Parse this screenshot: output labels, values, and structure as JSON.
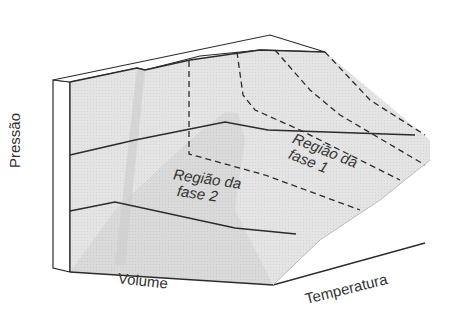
{
  "diagram": {
    "type": "3D phase diagram surface (P-V-T)",
    "axes": {
      "pressure": "Pressão",
      "volume": "Volume",
      "temperature": "Temperatura"
    },
    "regions": {
      "phase2": {
        "line1": "Região da",
        "line2": "fase 2"
      },
      "phase1": {
        "line1": "Região da",
        "line2": "fase 1"
      }
    },
    "colors": {
      "surface": "#e2e2e2",
      "surface_dark": "#d2d2d2",
      "line": "#2b2b2b",
      "text": "#333333",
      "background": "#ffffff"
    }
  }
}
